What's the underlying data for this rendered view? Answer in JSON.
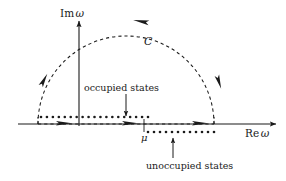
{
  "figure": {
    "axes": {
      "imaginary_axis_label": "Im",
      "imaginary_axis_variable": "ω",
      "real_axis_label": "Re",
      "real_axis_variable": "ω"
    },
    "contour": {
      "label": "C",
      "style": "dashed",
      "shape": "upper half-plane semicircle",
      "direction": "counterclockwise",
      "center_x": 126,
      "baseline_y": 124,
      "radius": 88,
      "left_end_x": 38,
      "right_end_x": 214,
      "top_y": 36
    },
    "chemical_potential": {
      "symbol": "μ",
      "x": 144,
      "tick_top_y": 120,
      "tick_bottom_y": 131
    },
    "annotations": [
      {
        "name": "occupied-states",
        "text": "occupied states",
        "text_x": 126,
        "text_y": 88,
        "arrow_from_y": 94,
        "arrow_to_y": 117,
        "arrow_x": 126,
        "arrow_direction": "down"
      },
      {
        "name": "unoccupied-states",
        "text": "unoccupied states",
        "text_x": 190,
        "text_y": 166,
        "arrow_from_y": 158,
        "arrow_to_y": 137,
        "arrow_x": 173,
        "arrow_direction": "up"
      }
    ],
    "poles": {
      "occupied": {
        "description": "occupied state poles below real axis drawn just above the axis line",
        "y": 117,
        "start_x": 41,
        "end_x": 148,
        "count": 19,
        "radius": 1.3,
        "color": "#1a1a1a"
      },
      "unoccupied": {
        "description": "unoccupied state poles above real axis drawn just below the axis line",
        "y": 132,
        "start_x": 148,
        "end_x": 214,
        "count": 12,
        "radius": 1.3,
        "color": "#1a1a1a"
      }
    },
    "contour_arrows": [
      {
        "name": "arc-left-up-arrow",
        "x": 44,
        "y": 80,
        "angle": -62
      },
      {
        "name": "arc-top-left-arrow",
        "x": 141,
        "y": 21,
        "angle": 190
      },
      {
        "name": "arc-right-down-arrow",
        "x": 219,
        "y": 82,
        "angle": 72
      },
      {
        "name": "base-arrow-1",
        "x": 64,
        "y": 124,
        "angle": 0
      },
      {
        "name": "base-arrow-2",
        "x": 130,
        "y": 124,
        "angle": 0
      },
      {
        "name": "base-arrow-3",
        "x": 200,
        "y": 124,
        "angle": 0
      }
    ],
    "colors": {
      "ink": "#1a1a1a",
      "background": "#ffffff"
    }
  }
}
